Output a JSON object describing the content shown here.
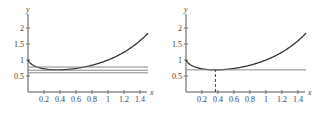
{
  "chart_data": [
    {
      "type": "line",
      "panel": "left",
      "title": "",
      "xlabel": "x",
      "ylabel": "y",
      "xlim": [
        0,
        1.5
      ],
      "ylim": [
        0,
        2.3
      ],
      "x_ticks": [
        "0.2",
        "0.4",
        "0.6",
        "0.8",
        "1",
        "1.2",
        "1.4"
      ],
      "y_ticks": [
        "0.5",
        "1",
        "1.5",
        "2"
      ],
      "grid": false,
      "series": [
        {
          "name": "curve y = x^x",
          "x": [
            0.0,
            0.05,
            0.1,
            0.2,
            0.3,
            0.368,
            0.5,
            0.6,
            0.8,
            1.0,
            1.2,
            1.4,
            1.5
          ],
          "values": [
            1.0,
            0.861,
            0.794,
            0.725,
            0.697,
            0.692,
            0.707,
            0.736,
            0.837,
            1.0,
            1.245,
            1.601,
            1.837
          ]
        },
        {
          "name": "horizontal line 1",
          "x": [
            0,
            1.5
          ],
          "values": [
            0.78,
            0.78
          ]
        },
        {
          "name": "horizontal line 2",
          "x": [
            0,
            1.5
          ],
          "values": [
            0.68,
            0.68
          ]
        },
        {
          "name": "horizontal line 3",
          "x": [
            0,
            1.5
          ],
          "values": [
            0.6,
            0.6
          ]
        }
      ]
    },
    {
      "type": "line",
      "panel": "right",
      "title": "",
      "xlabel": "x",
      "ylabel": "y",
      "xlim": [
        0,
        1.5
      ],
      "ylim": [
        0,
        2.3
      ],
      "x_ticks": [
        "0.2",
        "0.4",
        "0.6",
        "0.8",
        "1",
        "1.2",
        "1.4"
      ],
      "y_ticks": [
        "0.5",
        "1",
        "1.5",
        "2"
      ],
      "grid": false,
      "series": [
        {
          "name": "curve y = x^x",
          "x": [
            0.0,
            0.05,
            0.1,
            0.2,
            0.3,
            0.368,
            0.5,
            0.6,
            0.8,
            1.0,
            1.2,
            1.4,
            1.5
          ],
          "values": [
            1.0,
            0.861,
            0.794,
            0.725,
            0.697,
            0.692,
            0.707,
            0.736,
            0.837,
            1.0,
            1.245,
            1.601,
            1.837
          ]
        },
        {
          "name": "minimum horizontal line",
          "x": [
            0,
            1.5
          ],
          "values": [
            0.692,
            0.692
          ]
        }
      ],
      "annotations": [
        {
          "type": "dashed-vertical",
          "x": 0.368,
          "from_y": 0,
          "to_y": 0.692
        }
      ]
    }
  ],
  "colors": {
    "axis": "#555555",
    "curve": "#333333",
    "hline": "#888888",
    "text": "#444444"
  }
}
